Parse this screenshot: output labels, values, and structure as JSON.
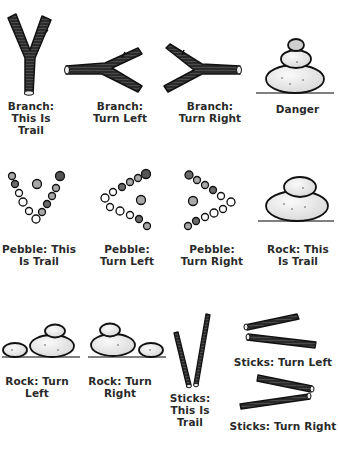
{
  "colors": {
    "ink": "#1e1e1e",
    "wood": "#2b2b2b",
    "stone_fill": "#eeeeee",
    "pebble_dark": "#6a6a6a",
    "pebble_mid": "#a8a8a8",
    "text": "#2a2a2a"
  },
  "signs": [
    {
      "id": "branch-this-is-trail",
      "label": "Branch:\nThis Is\nTrail",
      "icon": "y-branch-icon"
    },
    {
      "id": "branch-turn-left",
      "label": "Branch:\nTurn Left",
      "icon": "branch-left-icon"
    },
    {
      "id": "branch-turn-right",
      "label": "Branch:\nTurn Right",
      "icon": "branch-right-icon"
    },
    {
      "id": "danger",
      "label": "Danger",
      "icon": "stacked-rocks-icon"
    },
    {
      "id": "pebble-this-is-trail",
      "label": "Pebble: This\nIs Trail",
      "icon": "pebble-v-icon"
    },
    {
      "id": "pebble-turn-left",
      "label": "Pebble:\nTurn Left",
      "icon": "pebble-left-arrow-icon"
    },
    {
      "id": "pebble-turn-right",
      "label": "Pebble:\nTurn Right",
      "icon": "pebble-right-arrow-icon"
    },
    {
      "id": "rock-this-is-trail",
      "label": "Rock: This\nIs Trail",
      "icon": "two-rocks-stacked-icon"
    },
    {
      "id": "rock-turn-left",
      "label": "Rock: Turn\nLeft",
      "icon": "rocks-left-icon"
    },
    {
      "id": "rock-turn-right",
      "label": "Rock: Turn\nRight",
      "icon": "rocks-right-icon"
    },
    {
      "id": "sticks-this-is-trail",
      "label": "Sticks:\nThis Is\nTrail",
      "icon": "sticks-v-icon"
    },
    {
      "id": "sticks-turn-left",
      "label": "Sticks: Turn Left",
      "icon": "sticks-left-icon"
    },
    {
      "id": "sticks-turn-right",
      "label": "Sticks: Turn Right",
      "icon": "sticks-right-icon"
    }
  ]
}
